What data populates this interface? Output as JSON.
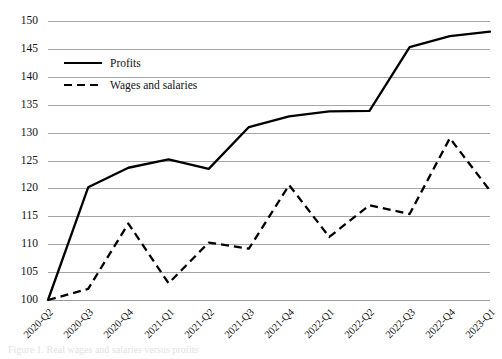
{
  "chart_data": {
    "type": "line",
    "title": "",
    "xlabel": "",
    "ylabel": "",
    "ylim": [
      100,
      150
    ],
    "ytick_step": 5,
    "yticks": [
      150,
      145,
      140,
      135,
      130,
      125,
      120,
      115,
      110,
      105,
      100
    ],
    "grid": true,
    "legend_position": "upper-left-inside",
    "categories": [
      "2020-Q2",
      "2020-Q3",
      "2020-Q4",
      "2021-Q1",
      "2021-Q2",
      "2021-Q3",
      "2021-Q4",
      "2022-Q1",
      "2022-Q2",
      "2022-Q3",
      "2022-Q4",
      "2023-Q1"
    ],
    "series": [
      {
        "name": "Profits",
        "style": "solid",
        "color": "#000000",
        "values": [
          100.0,
          120.2,
          123.7,
          125.2,
          123.5,
          131.0,
          132.9,
          133.8,
          133.9,
          145.3,
          147.3,
          148.1
        ]
      },
      {
        "name": "Wages and salaries",
        "style": "dashed",
        "color": "#000000",
        "values": [
          100.0,
          102.0,
          113.7,
          103.0,
          110.3,
          109.2,
          120.6,
          111.3,
          117.0,
          115.4,
          129.0,
          119.6
        ]
      }
    ]
  },
  "legend": {
    "items": [
      {
        "label": "Profits",
        "style": "solid"
      },
      {
        "label": "Wages and salaries",
        "style": "dashed"
      }
    ]
  },
  "caption": {
    "text": "Figure 1. Real wages and salaries versus profits"
  }
}
